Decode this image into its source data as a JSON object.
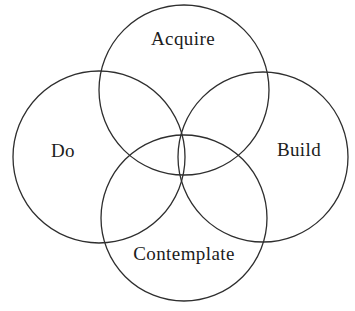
{
  "diagram": {
    "type": "venn-4-circles",
    "circles": [
      {
        "id": "acquire",
        "label": "Acquire",
        "cx": 184,
        "cy": 90,
        "r": 85
      },
      {
        "id": "do",
        "label": "Do",
        "cx": 99,
        "cy": 157,
        "r": 86
      },
      {
        "id": "build",
        "label": "Build",
        "cx": 263,
        "cy": 157,
        "r": 85
      },
      {
        "id": "contemplate",
        "label": "Contemplate",
        "cx": 184,
        "cy": 218,
        "r": 83
      }
    ]
  },
  "colors": {
    "stroke": "#2e2e2e",
    "text": "#1c1c1c",
    "background": "#ffffff"
  }
}
